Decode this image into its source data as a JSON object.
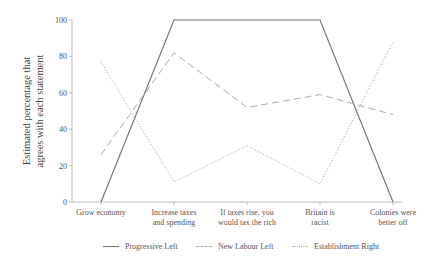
{
  "chart_data": {
    "type": "line",
    "title": "",
    "xlabel": "",
    "ylabel": "Estimated percentage that agrees with each statement",
    "ylabel_lines": [
      "Estimated percentage that",
      "agrees with each statement"
    ],
    "ylim": [
      0,
      100
    ],
    "yticks": [
      0,
      20,
      40,
      60,
      80,
      100
    ],
    "grid": false,
    "legend_position": "bottom",
    "categories": [
      "Grow economy",
      "Increase taxes and spending",
      "If taxes rise, you would tax the rich",
      "Britain is racist",
      "Colonies were better off"
    ],
    "category_label_lines": [
      [
        "Grow economy"
      ],
      [
        "Increase taxes",
        "and spending"
      ],
      [
        "If taxes rise, you",
        "would tax the rich"
      ],
      [
        "Britain is",
        "racist"
      ],
      [
        "Colonies were",
        "better off"
      ]
    ],
    "series": [
      {
        "name": "Progressive Left",
        "style": "solid",
        "color": "#777777",
        "values": [
          0,
          100,
          100,
          100,
          0
        ]
      },
      {
        "name": "New Labour Left",
        "style": "dashed",
        "color": "#aaaaaa",
        "values": [
          26,
          82,
          52,
          59,
          48
        ]
      },
      {
        "name": "Establishment Right",
        "style": "dotted",
        "color": "#aaaaaa",
        "values": [
          77,
          11,
          31,
          10,
          88
        ]
      }
    ]
  },
  "legend": {
    "items": [
      {
        "label": "Progressive Left"
      },
      {
        "label": "New Labour Left"
      },
      {
        "label": "Establishment Right"
      }
    ]
  }
}
